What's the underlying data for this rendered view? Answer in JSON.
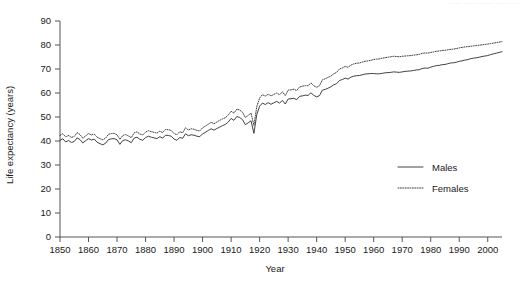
{
  "top_note": "......  ......  ....... ....  ...  ..",
  "legend": {
    "position": "inside-right",
    "items": [
      {
        "label": "Males",
        "style": "solid"
      },
      {
        "label": "Females",
        "style": "dotted"
      }
    ]
  },
  "chart_data": {
    "type": "line",
    "title": "",
    "subtitle": "",
    "xlabel": "Year",
    "ylabel": "Life expectancy (years)",
    "xlim": [
      1850,
      2005
    ],
    "ylim": [
      0,
      90
    ],
    "grid": false,
    "xticks": [
      1850,
      1860,
      1870,
      1880,
      1890,
      1900,
      1910,
      1920,
      1930,
      1940,
      1950,
      1960,
      1970,
      1980,
      1990,
      2000
    ],
    "yticks": [
      0,
      10,
      20,
      30,
      40,
      50,
      60,
      70,
      80,
      90
    ],
    "legend_entries": [
      "Males",
      "Females"
    ],
    "annotations": [
      "Sharp dip at 1918 influenza pandemic"
    ],
    "x": [
      1850,
      1851,
      1852,
      1853,
      1854,
      1855,
      1856,
      1857,
      1858,
      1859,
      1860,
      1861,
      1862,
      1863,
      1864,
      1865,
      1866,
      1867,
      1868,
      1869,
      1870,
      1871,
      1872,
      1873,
      1874,
      1875,
      1876,
      1877,
      1878,
      1879,
      1880,
      1881,
      1882,
      1883,
      1884,
      1885,
      1886,
      1887,
      1888,
      1889,
      1890,
      1891,
      1892,
      1893,
      1894,
      1895,
      1896,
      1897,
      1898,
      1899,
      1900,
      1901,
      1902,
      1903,
      1904,
      1905,
      1906,
      1907,
      1908,
      1909,
      1910,
      1911,
      1912,
      1913,
      1914,
      1915,
      1916,
      1917,
      1918,
      1919,
      1920,
      1921,
      1922,
      1923,
      1924,
      1925,
      1926,
      1927,
      1928,
      1929,
      1930,
      1931,
      1932,
      1933,
      1934,
      1935,
      1936,
      1937,
      1938,
      1939,
      1940,
      1941,
      1942,
      1943,
      1944,
      1945,
      1946,
      1947,
      1948,
      1949,
      1950,
      1951,
      1952,
      1953,
      1954,
      1955,
      1956,
      1957,
      1958,
      1959,
      1960,
      1961,
      1962,
      1963,
      1964,
      1965,
      1966,
      1967,
      1968,
      1969,
      1970,
      1971,
      1972,
      1973,
      1974,
      1975,
      1976,
      1977,
      1978,
      1979,
      1980,
      1981,
      1982,
      1983,
      1984,
      1985,
      1986,
      1987,
      1988,
      1989,
      1990,
      1991,
      1992,
      1993,
      1994,
      1995,
      1996,
      1997,
      1998,
      1999,
      2000,
      2001,
      2002,
      2003,
      2004,
      2005
    ],
    "series": [
      {
        "name": "Males",
        "style": "solid",
        "values": [
          40.3,
          40.9,
          39.6,
          40.2,
          39.4,
          39.8,
          41.3,
          40.6,
          39.2,
          40.1,
          41.0,
          40.4,
          40.8,
          39.5,
          38.9,
          38.4,
          39.1,
          40.6,
          40.9,
          41.0,
          40.5,
          38.6,
          40.2,
          40.5,
          40.0,
          39.3,
          41.2,
          41.6,
          40.7,
          40.3,
          41.4,
          42.0,
          41.6,
          41.3,
          41.0,
          41.8,
          41.2,
          42.4,
          42.3,
          42.0,
          40.8,
          40.3,
          41.5,
          41.1,
          43.0,
          42.2,
          42.6,
          42.4,
          42.0,
          41.8,
          43.0,
          43.6,
          44.4,
          45.1,
          44.5,
          45.2,
          45.8,
          46.4,
          46.9,
          47.9,
          49.4,
          48.6,
          50.2,
          49.8,
          48.9,
          46.8,
          47.6,
          48.4,
          43.2,
          51.0,
          54.5,
          55.8,
          55.2,
          56.0,
          55.3,
          55.9,
          56.5,
          55.8,
          56.9,
          55.4,
          57.5,
          57.6,
          57.8,
          57.2,
          58.6,
          58.8,
          59.1,
          59.0,
          60.1,
          59.0,
          58.4,
          58.9,
          61.2,
          61.5,
          62.0,
          62.6,
          63.4,
          63.9,
          65.2,
          65.6,
          66.2,
          65.8,
          66.6,
          67.0,
          67.2,
          67.3,
          67.6,
          67.9,
          68.0,
          68.1,
          68.1,
          68.0,
          68.0,
          68.2,
          68.4,
          68.5,
          68.6,
          68.8,
          68.7,
          68.6,
          68.8,
          69.0,
          69.1,
          69.2,
          69.4,
          69.6,
          69.7,
          70.2,
          70.4,
          70.3,
          70.8,
          71.1,
          71.4,
          71.5,
          71.8,
          71.9,
          72.2,
          72.5,
          72.6,
          72.8,
          73.2,
          73.4,
          73.7,
          73.9,
          74.3,
          74.5,
          74.7,
          74.9,
          75.2,
          75.4,
          75.6,
          76.0,
          76.3,
          76.6,
          76.9,
          77.2
        ]
      },
      {
        "name": "Females",
        "style": "dotted",
        "values": [
          42.4,
          43.0,
          41.7,
          42.3,
          41.5,
          41.9,
          43.5,
          42.7,
          41.2,
          42.1,
          43.1,
          42.5,
          42.9,
          41.6,
          41.0,
          40.5,
          41.2,
          42.8,
          43.1,
          43.2,
          42.6,
          40.7,
          42.3,
          42.7,
          42.1,
          41.4,
          43.4,
          43.8,
          42.9,
          42.5,
          43.7,
          44.3,
          43.9,
          43.6,
          43.3,
          44.1,
          43.5,
          44.8,
          44.7,
          44.4,
          43.1,
          42.6,
          43.9,
          43.4,
          45.5,
          44.6,
          45.1,
          44.9,
          44.4,
          44.2,
          45.5,
          46.2,
          47.0,
          47.8,
          47.2,
          47.9,
          48.6,
          49.2,
          49.7,
          50.8,
          52.4,
          51.6,
          53.3,
          52.9,
          52.0,
          49.8,
          50.7,
          51.6,
          46.5,
          54.3,
          57.9,
          59.3,
          58.7,
          59.5,
          58.8,
          59.4,
          60.0,
          59.3,
          60.5,
          58.9,
          61.2,
          61.3,
          61.6,
          61.0,
          62.5,
          62.8,
          63.1,
          63.0,
          64.2,
          63.0,
          62.4,
          63.0,
          65.5,
          65.9,
          66.5,
          67.1,
          68.0,
          68.6,
          70.0,
          70.4,
          71.1,
          70.7,
          71.6,
          72.1,
          72.4,
          72.5,
          72.9,
          73.2,
          73.4,
          73.6,
          74.0,
          74.1,
          74.2,
          74.5,
          74.7,
          74.9,
          75.1,
          75.3,
          75.2,
          75.1,
          75.3,
          75.4,
          75.5,
          75.6,
          75.8,
          75.9,
          76.1,
          76.5,
          76.7,
          76.6,
          76.9,
          77.1,
          77.4,
          77.5,
          77.7,
          77.8,
          78.0,
          78.2,
          78.3,
          78.5,
          78.8,
          79.0,
          79.2,
          79.3,
          79.5,
          79.6,
          79.8,
          79.9,
          80.1,
          80.2,
          80.4,
          80.6,
          80.8,
          81.0,
          81.2,
          81.4
        ]
      }
    ]
  }
}
